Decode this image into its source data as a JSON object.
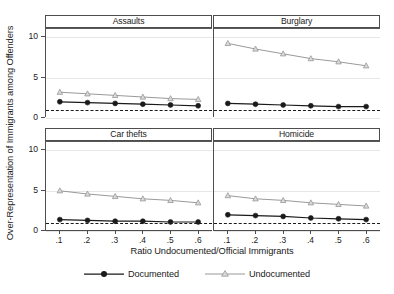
{
  "chart_data": {
    "type": "line",
    "title": "",
    "xlabel": "Ratio Undocumented/Official Immigrants",
    "ylabel": "Over-Representation of Immigrants among Offenders",
    "x": [
      0.1,
      0.2,
      0.3,
      0.4,
      0.5,
      0.6
    ],
    "xticklabels": [
      ".1",
      ".2",
      ".3",
      ".4",
      ".5",
      ".6"
    ],
    "yticklabels": [
      "0",
      "5",
      "10"
    ],
    "yticks": [
      0,
      5,
      10
    ],
    "ylim": [
      0,
      11
    ],
    "xlim": [
      0.05,
      0.65
    ],
    "grid": true,
    "grid_axis": "y",
    "legend_position": "bottom",
    "reference_line": {
      "value": 1.0,
      "style": "dashed",
      "color": "#1a1a1a"
    },
    "series_names": [
      "Documented",
      "Undocumented"
    ],
    "colors": {
      "Documented": "#1a1a1a",
      "Undocumented": "#8c8c8c"
    },
    "markers": {
      "Documented": "circle",
      "Undocumented": "triangle"
    },
    "panels": [
      {
        "title": "Assaults",
        "series": [
          {
            "name": "Documented",
            "values": [
              1.9,
              1.8,
              1.7,
              1.6,
              1.5,
              1.4
            ]
          },
          {
            "name": "Undocumented",
            "values": [
              3.1,
              2.9,
              2.7,
              2.5,
              2.3,
              2.2
            ]
          }
        ]
      },
      {
        "title": "Burglary",
        "series": [
          {
            "name": "Documented",
            "values": [
              1.7,
              1.6,
              1.5,
              1.4,
              1.3,
              1.3
            ]
          },
          {
            "name": "Undocumented",
            "values": [
              9.2,
              8.5,
              7.9,
              7.3,
              6.9,
              6.4
            ]
          }
        ]
      },
      {
        "title": "Car thefts",
        "series": [
          {
            "name": "Documented",
            "values": [
              1.3,
              1.2,
              1.1,
              1.1,
              1.0,
              1.0
            ]
          },
          {
            "name": "Undocumented",
            "values": [
              4.9,
              4.5,
              4.2,
              3.9,
              3.7,
              3.4
            ]
          }
        ]
      },
      {
        "title": "Homicide",
        "series": [
          {
            "name": "Documented",
            "values": [
              1.9,
              1.8,
              1.7,
              1.5,
              1.4,
              1.3
            ]
          },
          {
            "name": "Undocumented",
            "values": [
              4.3,
              3.9,
              3.7,
              3.4,
              3.2,
              3.0
            ]
          }
        ]
      }
    ]
  },
  "legend": {
    "entries": [
      {
        "label": "Documented",
        "marker": "circle-marker-icon",
        "color": "#1a1a1a"
      },
      {
        "label": "Undocumented",
        "marker": "triangle-marker-icon",
        "color": "#8c8c8c"
      }
    ]
  }
}
